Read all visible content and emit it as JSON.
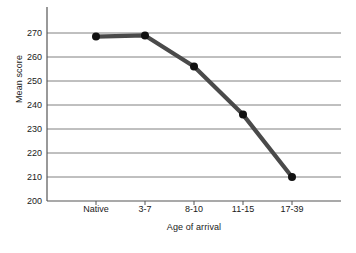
{
  "chart_data": {
    "type": "line",
    "title": "",
    "xlabel": "Age of arrival",
    "ylabel": "Mean score",
    "categories": [
      "Native",
      "3-7",
      "8-10",
      "11-15",
      "17-39"
    ],
    "values": [
      268.5,
      269,
      256,
      236,
      210
    ],
    "series": [
      {
        "name": "Mean score",
        "values": [
          268.5,
          269,
          256,
          236,
          210
        ]
      }
    ],
    "ylim": [
      200,
      270
    ],
    "yticks": [
      200,
      210,
      220,
      230,
      240,
      250,
      260,
      270
    ],
    "ytick_labels": [
      "200",
      "210",
      "220",
      "230",
      "240",
      "250",
      "260",
      "270"
    ],
    "xtick_labels": [
      "Native",
      "3-7",
      "8-10",
      "11-15",
      "17-39"
    ],
    "grid": "horizontal",
    "legend": "none",
    "line_color": "#4a4a4a",
    "marker_color": "#111111",
    "grid_color": "#808080",
    "axis_color": "#555555",
    "background_color": "#ffffff"
  }
}
